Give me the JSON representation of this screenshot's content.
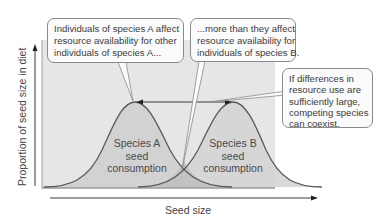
{
  "diagram": {
    "x_axis_label": "Seed size",
    "y_axis_label": "Proportion of seed size in diet",
    "curves": [
      {
        "id": "species-a",
        "label_lines": [
          "Species A",
          "seed",
          "consumption"
        ]
      },
      {
        "id": "species-b",
        "label_lines": [
          "Species B",
          "seed",
          "consumption"
        ]
      }
    ],
    "callouts": [
      {
        "id": "intraspecific",
        "lines": [
          "Individuals of species A affect",
          "resource availability for other",
          "individuals of species A..."
        ]
      },
      {
        "id": "interspecific",
        "lines": [
          "...more than they affect",
          "resource availability for",
          "individuals of species B."
        ]
      },
      {
        "id": "coexistence",
        "lines": [
          "If differences in",
          "resource use are",
          "sufficiently large,",
          "competing species",
          "can coexist."
        ]
      }
    ],
    "colors": {
      "plot_background": "#e6e6e6",
      "curve_fill": "#d3d3d3",
      "overlap_fill": "#c4c4c4",
      "curve_stroke": "#5a5a5a",
      "axis": "#3a3a3a",
      "callout_border": "#8a8a8a"
    }
  }
}
